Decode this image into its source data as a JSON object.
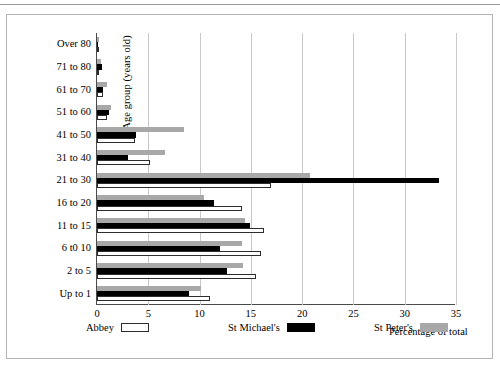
{
  "chart_data": {
    "type": "bar",
    "orientation": "horizontal",
    "title": "",
    "xlabel": "Percentage of total",
    "ylabel": "Age group (years old)",
    "xlim": [
      0,
      35
    ],
    "xticks": [
      0,
      5,
      10,
      15,
      20,
      25,
      30,
      35
    ],
    "xtick_labels": [
      "0",
      "5",
      "10",
      "15",
      "20",
      "25",
      "30",
      "35"
    ],
    "grid": "vertical",
    "legend_position": "bottom",
    "categories": [
      "Over 80",
      "71 to 80",
      "61 to 70",
      "51 to 60",
      "41 to 50",
      "31 to 40",
      "21 to 30",
      "16 to 20",
      "11 to 15",
      "6 t0 10",
      "2 to 5",
      "Up to 1"
    ],
    "series": [
      {
        "name": "Abbey",
        "color": "#ffffff",
        "edge_color": "#2d2d2d",
        "values": [
          0.1,
          0.2,
          0.6,
          1.0,
          3.7,
          5.2,
          17.0,
          14.1,
          16.3,
          16.0,
          15.5,
          11.0
        ]
      },
      {
        "name": "St Michael's",
        "color": "#000000",
        "values": [
          0.0,
          0.5,
          0.6,
          1.2,
          3.8,
          3.0,
          33.3,
          11.4,
          14.9,
          12.0,
          12.7,
          9.0
        ]
      },
      {
        "name": "St Peter's",
        "color": "#a8a8a8",
        "values": [
          0.2,
          0.4,
          1.0,
          1.4,
          8.5,
          6.6,
          20.8,
          10.4,
          14.4,
          14.1,
          14.2,
          10.1
        ]
      }
    ]
  }
}
